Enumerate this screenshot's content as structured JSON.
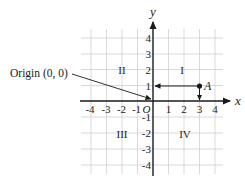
{
  "diagram": {
    "type": "coordinate-plane",
    "axes": {
      "x_label": "x",
      "y_label": "y",
      "x_ticks": [
        {
          "value": -4,
          "label": "-4"
        },
        {
          "value": -3,
          "label": "-3"
        },
        {
          "value": -2,
          "label": "-2"
        },
        {
          "value": -1,
          "label": "-1"
        },
        {
          "value": 1,
          "label": "1"
        },
        {
          "value": 2,
          "label": "2"
        },
        {
          "value": 3,
          "label": "3"
        },
        {
          "value": 4,
          "label": "4"
        }
      ],
      "y_ticks": [
        {
          "value": 4,
          "label": "4"
        },
        {
          "value": 3,
          "label": "3"
        },
        {
          "value": 2,
          "label": "2"
        },
        {
          "value": 1,
          "label": "1"
        },
        {
          "value": -1,
          "label": "-1"
        },
        {
          "value": -2,
          "label": "-2"
        },
        {
          "value": -3,
          "label": "-3"
        },
        {
          "value": -4,
          "label": "-4"
        }
      ],
      "origin_label": "O",
      "range": {
        "x": [
          -4,
          4
        ],
        "y": [
          -4,
          4
        ]
      }
    },
    "quadrants": {
      "q1": "I",
      "q2": "II",
      "q3": "III",
      "q4": "IV"
    },
    "point": {
      "label": "A",
      "x": 3,
      "y": 1
    },
    "callout": {
      "text": "Origin (0, 0)"
    },
    "colors": {
      "grid": "#cfcfcf",
      "axis": "#1a1a1a",
      "text": "#222222"
    }
  }
}
